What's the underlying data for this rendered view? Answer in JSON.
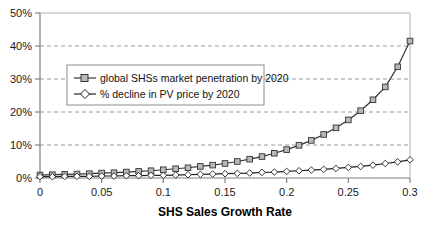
{
  "chart_data": {
    "type": "line",
    "title": "",
    "subtitle": "",
    "xlabel": "SHS Sales Growth Rate",
    "ylabel": "",
    "xlim": [
      0,
      0.3
    ],
    "ylim": [
      0,
      0.5
    ],
    "grid": true,
    "grid_axis": "y",
    "legend_position": "upper-left-inside",
    "x_tick_labels": [
      "0",
      "0.05",
      "0.1",
      "0.15",
      "0.2",
      "0.25",
      "0.3"
    ],
    "x_ticks": [
      0,
      0.05,
      0.1,
      0.15,
      0.2,
      0.25,
      0.3
    ],
    "y_tick_labels": [
      "0%",
      "10%",
      "20%",
      "30%",
      "40%",
      "50%"
    ],
    "y_ticks": [
      0,
      0.1,
      0.2,
      0.3,
      0.4,
      0.5
    ],
    "x": [
      0,
      0.01,
      0.02,
      0.03,
      0.04,
      0.05,
      0.06,
      0.07,
      0.08,
      0.09,
      0.1,
      0.11,
      0.12,
      0.13,
      0.14,
      0.15,
      0.16,
      0.17,
      0.18,
      0.19,
      0.2,
      0.21,
      0.22,
      0.23,
      0.24,
      0.25,
      0.26,
      0.27,
      0.28,
      0.29,
      0.3
    ],
    "series": [
      {
        "name": "global SHSs market penetration by 2020",
        "marker": "square",
        "marker_fill": "#b8b8b8",
        "line_color": "#333333",
        "values": [
          0.009,
          0.01,
          0.011,
          0.012,
          0.013,
          0.015,
          0.016,
          0.018,
          0.02,
          0.022,
          0.025,
          0.028,
          0.031,
          0.035,
          0.039,
          0.044,
          0.05,
          0.057,
          0.065,
          0.075,
          0.086,
          0.099,
          0.114,
          0.132,
          0.152,
          0.176,
          0.204,
          0.237,
          0.276,
          0.337,
          0.415
        ]
      },
      {
        "name": "% decline in PV price by 2020",
        "marker": "diamond",
        "marker_fill": "#ffffff",
        "line_color": "#222222",
        "values": [
          0.004,
          0.004,
          0.005,
          0.005,
          0.005,
          0.006,
          0.006,
          0.007,
          0.007,
          0.008,
          0.008,
          0.009,
          0.01,
          0.011,
          0.012,
          0.013,
          0.014,
          0.015,
          0.017,
          0.018,
          0.02,
          0.022,
          0.024,
          0.026,
          0.029,
          0.032,
          0.035,
          0.039,
          0.044,
          0.049,
          0.055
        ]
      }
    ],
    "colors": {
      "axis": "#808080",
      "gridline": "#9a9a9a",
      "plot_background": "#ffffff",
      "legend_border": "#8c8c8c",
      "series_square_fill": "#b8b8b8",
      "series_diamond_fill": "#ffffff",
      "text": "#1a1a1a"
    }
  },
  "legend": {
    "items": [
      {
        "label": "global SHSs market penetration by 2020",
        "marker": "square-marker"
      },
      {
        "label": "% decline in PV price by 2020",
        "marker": "diamond-marker"
      }
    ]
  },
  "axes": {
    "x_title": "SHS Sales Growth Rate",
    "x_labels": [
      "0",
      "0.05",
      "0.1",
      "0.15",
      "0.2",
      "0.25",
      "0.3"
    ],
    "y_labels": [
      "0%",
      "10%",
      "20%",
      "30%",
      "40%",
      "50%"
    ]
  }
}
